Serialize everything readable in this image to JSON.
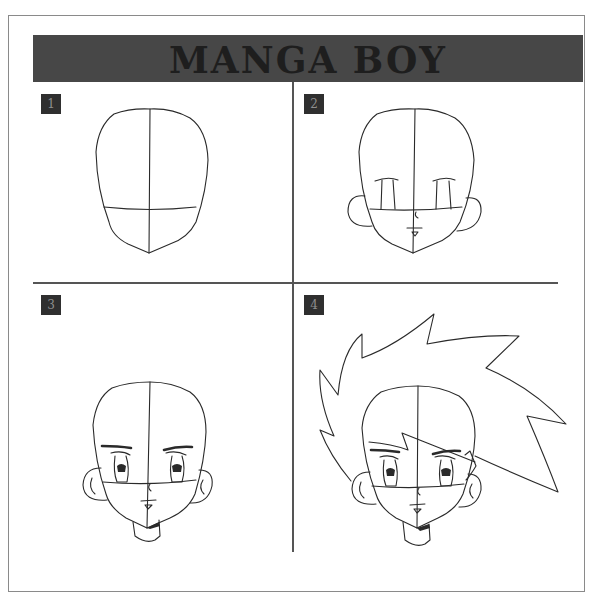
{
  "title": "MANGA BOY",
  "colors": {
    "banner_background": "#474747",
    "title_text": "#1e1e1e",
    "badge_background": "#2f2f2f",
    "badge_text": "#8e8e8e",
    "line": "#2a2a2a",
    "frame_border": "#8a8a8a"
  },
  "panels": [
    {
      "step": "1",
      "description": "Head outline with vertical center line and horizontal eye guideline"
    },
    {
      "step": "2",
      "description": "Add ears, eye outlines, nose and mouth"
    },
    {
      "step": "3",
      "description": "Add eyebrows, detailed eyes with highlights, ear details and neck"
    },
    {
      "step": "4",
      "description": "Add spiky hair with fringe over the forehead"
    }
  ]
}
